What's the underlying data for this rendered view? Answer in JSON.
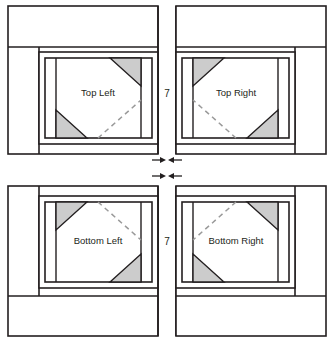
{
  "diagram": {
    "type": "quilt-block-diagram",
    "canvas": {
      "width": 333,
      "height": 338
    },
    "colors": {
      "stroke": "#231f20",
      "background": "#ffffff",
      "triangle_fill": "#cccccc",
      "text": "#231f20",
      "dashed": "#9a9a9a"
    },
    "quadrants": [
      {
        "id": "top-left",
        "label": "Top Left",
        "row": "top",
        "col": "left"
      },
      {
        "id": "top-right",
        "label": "Top Right",
        "row": "top",
        "col": "right"
      },
      {
        "id": "bottom-left",
        "label": "Bottom Left",
        "row": "bottom",
        "col": "left"
      },
      {
        "id": "bottom-right",
        "label": "Bottom Right",
        "row": "bottom",
        "col": "right"
      }
    ],
    "seam_labels": [
      {
        "id": "seam-top",
        "value": "7"
      },
      {
        "id": "seam-bottom",
        "value": "7"
      }
    ],
    "arrow_markers": [
      {
        "id": "arrow-pair-top",
        "left_glyph": "arrow-right-icon",
        "right_glyph": "arrow-left-icon"
      },
      {
        "id": "arrow-pair-bottom",
        "left_glyph": "arrow-right-icon",
        "right_glyph": "arrow-left-icon"
      }
    ]
  }
}
